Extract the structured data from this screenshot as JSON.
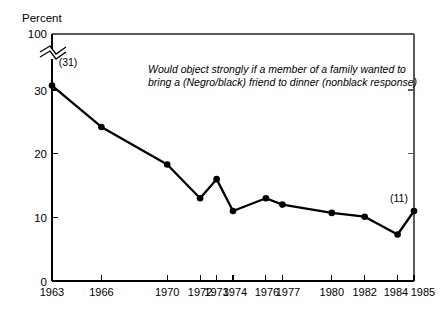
{
  "chart_data": {
    "type": "line",
    "title": "",
    "subtitle": "",
    "ylabel": "Percent",
    "xlabel": "",
    "annotation": {
      "line1": "Would object strongly if a member of a family wanted to",
      "line2": "bring a (Negro/black) friend to dinner (nonblack response)"
    },
    "x": [
      1963,
      1966,
      1970,
      1972,
      1973,
      1974,
      1976,
      1977,
      1980,
      1982,
      1984,
      1985
    ],
    "xtick_labels": [
      "1963",
      "1966",
      "1970",
      "1972",
      "1973",
      "1974",
      "1976",
      "1977",
      "1980",
      "1982",
      "1984",
      "1985"
    ],
    "values": [
      30.7,
      24.2,
      18.3,
      13.0,
      16.0,
      11.0,
      13.0,
      12.0,
      10.7,
      10.1,
      7.3,
      11.0
    ],
    "ytick_labels": [
      "0",
      "10",
      "20",
      "30",
      "100"
    ],
    "ytick_values": [
      0,
      10,
      20,
      30,
      100
    ],
    "ylim": [
      0,
      100
    ],
    "xlim": [
      1963,
      1985
    ],
    "axis_break": true,
    "axis_break_note": "y-axis broken between 30 and 100",
    "grid": false,
    "legend": "none",
    "point_labels": [
      {
        "x": 1963,
        "value": 30.7,
        "text": "(31)"
      },
      {
        "x": 1985,
        "value": 11.0,
        "text": "(11)"
      }
    ],
    "series_color": "#000000",
    "frame_color": "#555a5e"
  }
}
